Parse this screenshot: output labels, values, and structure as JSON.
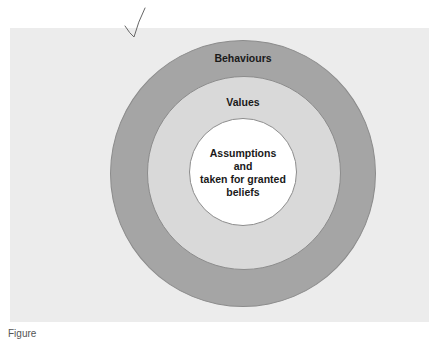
{
  "diagram": {
    "type": "concentric-circles",
    "layers": [
      {
        "label": "Behaviours",
        "position": "outer",
        "color": "#a5a5a5"
      },
      {
        "label": "Values",
        "position": "middle",
        "color": "#d9d9d9"
      },
      {
        "label_lines": [
          "Assumptions",
          "and",
          "taken for granted",
          "beliefs"
        ],
        "position": "inner",
        "color": "#ffffff"
      }
    ],
    "background_color": "#ececec",
    "annotation": "handwritten-checkmark"
  },
  "caption": {
    "text": "Figure"
  }
}
